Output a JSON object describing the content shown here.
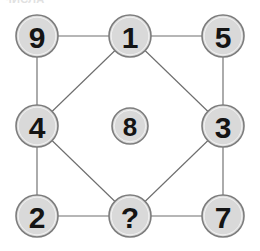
{
  "header": {
    "clipped_text": "ЧИСЛА"
  },
  "puzzle": {
    "title": "Number grid logic puzzle",
    "missing_marker": "?",
    "colors": {
      "node_fill": "#d9d9d9",
      "node_stroke": "#7d7d7d",
      "edge_stroke": "#6e6e6e",
      "label_color": "#141414",
      "background": "#ffffff"
    },
    "nodes": [
      {
        "id": "n9",
        "label": "9",
        "cx": 37,
        "cy": 36,
        "r": 21,
        "position": "top-left"
      },
      {
        "id": "n1",
        "label": "1",
        "cx": 130,
        "cy": 36,
        "r": 21,
        "position": "top-center"
      },
      {
        "id": "n5",
        "label": "5",
        "cx": 223,
        "cy": 36,
        "r": 21,
        "position": "top-right"
      },
      {
        "id": "n4",
        "label": "4",
        "cx": 37,
        "cy": 126,
        "r": 21,
        "position": "middle-left"
      },
      {
        "id": "n8",
        "label": "8",
        "cx": 130,
        "cy": 126,
        "r": 18,
        "position": "center"
      },
      {
        "id": "n3",
        "label": "3",
        "cx": 223,
        "cy": 126,
        "r": 21,
        "position": "middle-right"
      },
      {
        "id": "n2",
        "label": "2",
        "cx": 37,
        "cy": 216,
        "r": 21,
        "position": "bottom-left"
      },
      {
        "id": "nUnknown",
        "label": "?",
        "cx": 130,
        "cy": 216,
        "r": 21,
        "position": "bottom-center"
      },
      {
        "id": "n7",
        "label": "7",
        "cx": 223,
        "cy": 216,
        "r": 21,
        "position": "bottom-right"
      }
    ],
    "edges": [
      {
        "id": "e-9-1",
        "from": "n9",
        "to": "n1",
        "kind": "horizontal"
      },
      {
        "id": "e-1-5",
        "from": "n1",
        "to": "n5",
        "kind": "horizontal"
      },
      {
        "id": "e-9-4",
        "from": "n9",
        "to": "n4",
        "kind": "vertical"
      },
      {
        "id": "e-5-3",
        "from": "n5",
        "to": "n3",
        "kind": "vertical"
      },
      {
        "id": "e-4-2",
        "from": "n4",
        "to": "n2",
        "kind": "vertical"
      },
      {
        "id": "e-3-7",
        "from": "n3",
        "to": "n7",
        "kind": "vertical"
      },
      {
        "id": "e-2-q",
        "from": "n2",
        "to": "nUnknown",
        "kind": "horizontal"
      },
      {
        "id": "e-q-7",
        "from": "nUnknown",
        "to": "n7",
        "kind": "horizontal"
      },
      {
        "id": "e-1-4",
        "from": "n1",
        "to": "n4",
        "kind": "diagonal"
      },
      {
        "id": "e-1-3",
        "from": "n1",
        "to": "n3",
        "kind": "diagonal"
      },
      {
        "id": "e-4-q",
        "from": "n4",
        "to": "nUnknown",
        "kind": "diagonal"
      },
      {
        "id": "e-3-q",
        "from": "n3",
        "to": "nUnknown",
        "kind": "diagonal"
      }
    ]
  }
}
